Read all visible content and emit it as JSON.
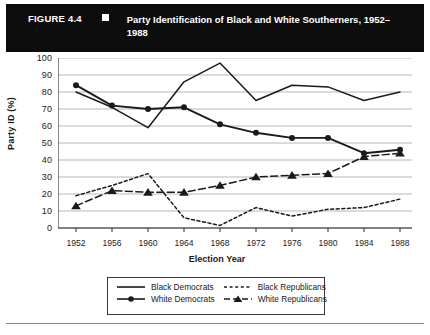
{
  "header": {
    "figure_number": "FIGURE 4.4",
    "bullet_icon": "square-bullet-icon",
    "title": "Party Identification of Black and White Southerners, 1952–1988"
  },
  "chart_data": {
    "type": "line",
    "title": "Party Identification of Black and White Southerners, 1952–1988",
    "xlabel": "Election Year",
    "ylabel": "Party ID (%)",
    "categories": [
      1952,
      1956,
      1960,
      1964,
      1968,
      1972,
      1976,
      1980,
      1984,
      1988
    ],
    "xtick_labels": [
      "1952",
      "1956",
      "1960",
      "1964",
      "1968",
      "1972",
      "1976",
      "1980",
      "1984",
      "1988"
    ],
    "ytick_labels": [
      "0",
      "10",
      "20",
      "30",
      "40",
      "50",
      "60",
      "70",
      "80",
      "90",
      "100"
    ],
    "ylim": [
      0,
      100
    ],
    "ytick_step": 10,
    "grid": "horizontal",
    "legend_position": "bottom",
    "series": [
      {
        "name": "Black Democrats",
        "style": "solid",
        "marker": "none",
        "color": "#1a1a1a",
        "values": [
          80,
          71,
          59,
          86,
          97,
          75,
          84,
          83,
          75,
          80
        ]
      },
      {
        "name": "White Democrats",
        "style": "solid",
        "marker": "circle",
        "color": "#1a1a1a",
        "values": [
          84,
          72,
          70,
          71,
          61,
          56,
          53,
          53,
          44,
          46
        ]
      },
      {
        "name": "Black Republicans",
        "style": "dotted",
        "marker": "none",
        "color": "#1a1a1a",
        "values": [
          19,
          25,
          32,
          6,
          1.5,
          12,
          7,
          11,
          12,
          17
        ]
      },
      {
        "name": "White Republicans",
        "style": "dashed",
        "marker": "triangle",
        "color": "#1a1a1a",
        "values": [
          13,
          22,
          21,
          21,
          25,
          30,
          31,
          32,
          42,
          44
        ]
      }
    ]
  },
  "legend": {
    "items": [
      {
        "label": "Black Democrats",
        "swatch": "solid-line-icon"
      },
      {
        "label": "Black Republicans",
        "swatch": "dotted-line-icon"
      },
      {
        "label": "White Democrats",
        "swatch": "solid-line-circle-icon"
      },
      {
        "label": "White Republicans",
        "swatch": "dashed-line-triangle-icon"
      }
    ]
  }
}
